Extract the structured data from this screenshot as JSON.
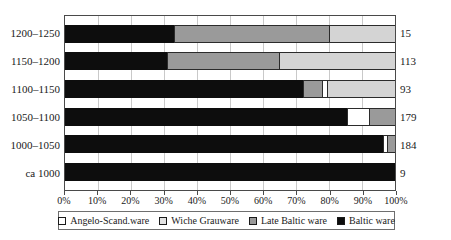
{
  "chart_data": {
    "type": "bar",
    "orientation": "horizontal",
    "stacked": true,
    "normalized_percent": true,
    "title": "",
    "xlabel": "",
    "ylabel": "",
    "xlim": [
      0,
      100
    ],
    "grid": true,
    "legend_position": "bottom",
    "categories": [
      "1200–1250",
      "1150–1200",
      "1100–1150",
      "1050–1100",
      "1000–1050",
      "ca 1000"
    ],
    "counts": [
      15,
      113,
      93,
      179,
      184,
      9
    ],
    "xtick_labels": [
      "0%",
      "10%",
      "20%",
      "30%",
      "40%",
      "50%",
      "60%",
      "70%",
      "80%",
      "90%",
      "100%"
    ],
    "xtick_values": [
      0,
      10,
      20,
      30,
      40,
      50,
      60,
      70,
      80,
      90,
      100
    ],
    "series": [
      {
        "name": "Angelo-Scand.ware",
        "color": "#ffffff",
        "values": [
          0,
          0,
          1.5,
          6.5,
          1.0,
          0
        ]
      },
      {
        "name": "Wiche Grauware",
        "color": "#d4d4d4",
        "values": [
          20.0,
          35.0,
          20.5,
          0,
          0,
          0
        ]
      },
      {
        "name": "Late Baltic ware",
        "color": "#9a9a9a",
        "values": [
          47.0,
          34.0,
          6.0,
          8.0,
          2.5,
          0
        ]
      },
      {
        "name": "Baltic ware",
        "color": "#0d0d0d",
        "values": [
          33.0,
          31.0,
          72.0,
          85.5,
          96.5,
          100.0
        ]
      }
    ],
    "stack_order": [
      "Baltic ware",
      "Late Baltic ware",
      "Angelo-Scand.ware",
      "Wiche Grauware"
    ],
    "rows": [
      {
        "category": "1200–1250",
        "count": 15,
        "segments": [
          {
            "series": "Baltic ware",
            "value": 33.0
          },
          {
            "series": "Late Baltic ware",
            "value": 47.0
          },
          {
            "series": "Wiche Grauware",
            "value": 20.0
          }
        ]
      },
      {
        "category": "1150–1200",
        "count": 113,
        "segments": [
          {
            "series": "Baltic ware",
            "value": 31.0
          },
          {
            "series": "Late Baltic ware",
            "value": 34.0
          },
          {
            "series": "Wiche Grauware",
            "value": 35.0
          }
        ]
      },
      {
        "category": "1100–1150",
        "count": 93,
        "segments": [
          {
            "series": "Baltic ware",
            "value": 72.0
          },
          {
            "series": "Late Baltic ware",
            "value": 6.0
          },
          {
            "series": "Angelo-Scand.ware",
            "value": 1.5
          },
          {
            "series": "Wiche Grauware",
            "value": 20.5
          }
        ]
      },
      {
        "category": "1050–1100",
        "count": 179,
        "segments": [
          {
            "series": "Baltic ware",
            "value": 85.5
          },
          {
            "series": "Angelo-Scand.ware",
            "value": 6.5
          },
          {
            "series": "Late Baltic ware",
            "value": 8.0
          }
        ]
      },
      {
        "category": "1000–1050",
        "count": 184,
        "segments": [
          {
            "series": "Baltic ware",
            "value": 96.5
          },
          {
            "series": "Angelo-Scand.ware",
            "value": 1.0
          },
          {
            "series": "Late Baltic ware",
            "value": 2.5
          }
        ]
      },
      {
        "category": "ca 1000",
        "count": 9,
        "segments": [
          {
            "series": "Baltic ware",
            "value": 100.0
          }
        ]
      }
    ]
  },
  "legend": {
    "items": [
      {
        "label": "Angelo-Scand.ware",
        "swatch": "angelo"
      },
      {
        "label": "Wiche Grauware",
        "swatch": "wiche"
      },
      {
        "label": "Late Baltic ware",
        "swatch": "late"
      },
      {
        "label": "Baltic ware",
        "swatch": "baltic"
      }
    ]
  }
}
